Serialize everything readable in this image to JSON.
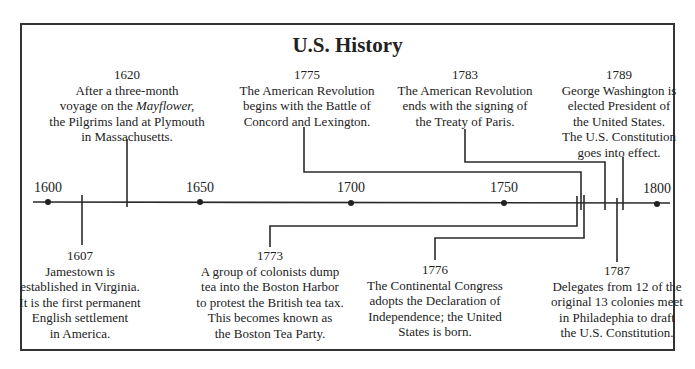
{
  "title": "U.S. History",
  "axis": {
    "labels": [
      {
        "year": "1600",
        "x": 48
      },
      {
        "year": "1650",
        "x": 200
      },
      {
        "year": "1700",
        "x": 351
      },
      {
        "year": "1750",
        "x": 504
      },
      {
        "year": "1800",
        "x": 657
      }
    ]
  },
  "events": [
    {
      "year": "1607",
      "lines": [
        "Jamestown is",
        "established in Virginia.",
        "It is the first permanent",
        "English settlement",
        "in America."
      ],
      "position": "below"
    },
    {
      "year": "1620",
      "lines": [
        "After a three-month",
        "voyage on the Mayflower,",
        "the Pilgrims land at Plymouth",
        "in Massachusetts."
      ],
      "italic_word": "Mayflower,",
      "position": "above"
    },
    {
      "year": "1773",
      "lines": [
        "A group of colonists dump",
        "tea into the Boston Harbor",
        "to protest the British tea tax.",
        "This becomes known as",
        "the Boston Tea Party."
      ],
      "position": "below"
    },
    {
      "year": "1775",
      "lines": [
        "The American Revolution",
        "begins with the Battle of",
        "Concord and Lexington."
      ],
      "position": "above"
    },
    {
      "year": "1776",
      "lines": [
        "The Continental Congress",
        "adopts the Declaration of",
        "Independence; the United",
        "States is born."
      ],
      "position": "below"
    },
    {
      "year": "1783",
      "lines": [
        "The American Revolution",
        "ends with the signing of",
        "the Treaty of Paris."
      ],
      "position": "above"
    },
    {
      "year": "1787",
      "lines": [
        "Delegates from 12 of the",
        "original 13 colonies meet",
        "in Philadephia to draft",
        "the U.S. Constitution."
      ],
      "position": "below"
    },
    {
      "year": "1789",
      "lines": [
        "George Washington is",
        "elected President of",
        "the United States.",
        "The U.S. Constitution",
        "goes into effect."
      ],
      "position": "above"
    }
  ],
  "colors": {
    "line": "#2a2a2a",
    "frame": "#333333",
    "text": "#222222"
  }
}
